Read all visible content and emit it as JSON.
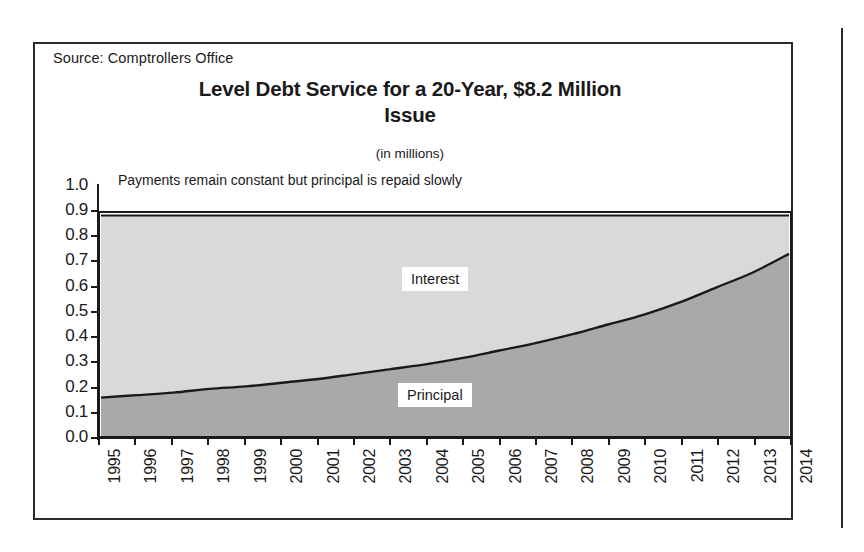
{
  "figure": {
    "source_note": "Source: Comptrollers Office",
    "title_line1": "Level Debt Service for a 20-Year, $8.2 Million",
    "title_line2": "Issue",
    "subtitle": "(in millions)",
    "annotation": "Payments remain constant but principal is repaid slowly"
  },
  "colors": {
    "interest_fill": "#d9d9d9",
    "principal_fill": "#a9a9a9",
    "line": "#1a1a1a",
    "axis": "#1a1a1a",
    "frame": "#2b2b2b",
    "background": "#ffffff"
  },
  "chart_data": {
    "type": "area",
    "title": "Level Debt Service for a 20-Year, $8.2 Million Issue",
    "subtitle": "(in millions)",
    "xlabel": "",
    "ylabel": "",
    "ylim": [
      0.0,
      1.0
    ],
    "ytick_labels": [
      "1.0",
      "0.9",
      "0.8",
      "0.7",
      "0.6",
      "0.5",
      "0.4",
      "0.3",
      "0.2",
      "0.1",
      "0.0"
    ],
    "ytick_values": [
      1.0,
      0.9,
      0.8,
      0.7,
      0.6,
      0.5,
      0.4,
      0.3,
      0.2,
      0.1,
      0.0
    ],
    "grid": false,
    "stacked": true,
    "legend_position": "inline-labels",
    "categories": [
      "1995",
      "1996",
      "1997",
      "1998",
      "1999",
      "2000",
      "2001",
      "2002",
      "2003",
      "2004",
      "2005",
      "2006",
      "2007",
      "2008",
      "2009",
      "2010",
      "2011",
      "2012",
      "2013",
      "2014"
    ],
    "series": [
      {
        "name": "Principal",
        "values": [
          0.155,
          0.165,
          0.175,
          0.19,
          0.2,
          0.215,
          0.23,
          0.25,
          0.27,
          0.29,
          0.315,
          0.345,
          0.375,
          0.41,
          0.45,
          0.49,
          0.54,
          0.6,
          0.66,
          0.735
        ]
      },
      {
        "name": "Interest",
        "values": [
          0.735,
          0.725,
          0.715,
          0.7,
          0.69,
          0.675,
          0.66,
          0.64,
          0.62,
          0.6,
          0.575,
          0.545,
          0.515,
          0.48,
          0.44,
          0.4,
          0.35,
          0.29,
          0.23,
          0.155
        ]
      }
    ],
    "total_debt_service": [
      0.89,
      0.89,
      0.89,
      0.89,
      0.89,
      0.89,
      0.89,
      0.89,
      0.89,
      0.89,
      0.89,
      0.89,
      0.89,
      0.89,
      0.89,
      0.89,
      0.89,
      0.89,
      0.89,
      0.89
    ],
    "annotations": [
      {
        "text": "Payments remain constant but principal is repaid slowly",
        "position": "top-left"
      },
      {
        "text": "Interest",
        "position": "upper-band"
      },
      {
        "text": "Principal",
        "position": "lower-band"
      }
    ]
  }
}
